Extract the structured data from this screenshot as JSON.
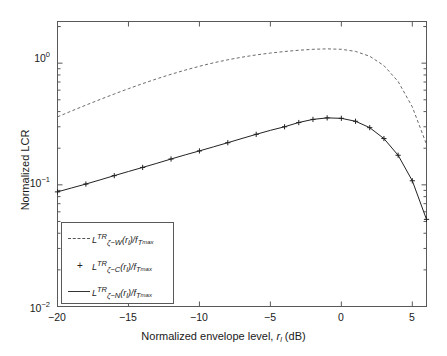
{
  "chart_data": {
    "type": "line",
    "title": "",
    "xlabel": "Normalized envelope level, r_l (dB)",
    "ylabel": "Normalized LCR",
    "xlim": [
      -20,
      6
    ],
    "ylim": [
      0.01,
      2.2
    ],
    "yscale": "log",
    "xticks": [
      -20,
      -15,
      -10,
      -5,
      0,
      5
    ],
    "xticklabels": [
      "−20",
      "−15",
      "−10",
      "−5",
      "0",
      "5"
    ],
    "yticks": [
      0.01,
      0.1,
      1
    ],
    "yticklabels": [
      "10",
      "10",
      "10"
    ],
    "ytick_exponents": [
      "−2",
      "−1",
      "0"
    ],
    "grid": false,
    "legend_position": "lower left",
    "series": [
      {
        "name": "L_zeta-W^TR(r_l)/f_Tmax",
        "style": "dashed",
        "color": "#5a5a5a",
        "marker": "none",
        "x": [
          -20,
          -19,
          -18,
          -17,
          -16,
          -15,
          -14,
          -13,
          -12,
          -11,
          -10,
          -9,
          -8,
          -7,
          -6,
          -5,
          -4,
          -3,
          -2,
          -1,
          0,
          1,
          2,
          3,
          4,
          5,
          6
        ],
        "y": [
          0.362,
          0.405,
          0.452,
          0.503,
          0.558,
          0.617,
          0.679,
          0.744,
          0.81,
          0.877,
          0.943,
          1.007,
          1.066,
          1.12,
          1.169,
          1.211,
          1.247,
          1.277,
          1.3,
          1.311,
          1.3,
          1.249,
          1.14,
          0.955,
          0.707,
          0.437,
          0.215
        ]
      },
      {
        "name": "L_zeta-C^TR(r_l)/f_Tmax",
        "style": "markers",
        "color": "#222222",
        "marker": "+",
        "x": [
          -20,
          -18,
          -16,
          -14,
          -12,
          -10,
          -8,
          -6,
          -4,
          -3,
          -2,
          -1,
          0,
          1,
          2,
          3,
          4,
          5,
          6
        ],
        "y": [
          0.0875,
          0.1015,
          0.119,
          0.139,
          0.163,
          0.19,
          0.222,
          0.26,
          0.3,
          0.325,
          0.345,
          0.355,
          0.352,
          0.333,
          0.295,
          0.24,
          0.175,
          0.108,
          0.052
        ]
      },
      {
        "name": "L_zeta-N^TR(r_l)/f_Tmax",
        "style": "solid",
        "color": "#222222",
        "marker": "none",
        "x": [
          -20,
          -19,
          -18,
          -17,
          -16,
          -15,
          -14,
          -13,
          -12,
          -11,
          -10,
          -9,
          -8,
          -7,
          -6,
          -5,
          -4,
          -3,
          -2,
          -1,
          0,
          1,
          2,
          3,
          4,
          5,
          6
        ],
        "y": [
          0.0875,
          0.0943,
          0.1015,
          0.1098,
          0.119,
          0.1287,
          0.139,
          0.1503,
          0.163,
          0.1763,
          0.19,
          0.2053,
          0.222,
          0.2405,
          0.26,
          0.2805,
          0.3,
          0.3255,
          0.345,
          0.355,
          0.352,
          0.333,
          0.295,
          0.24,
          0.175,
          0.108,
          0.052
        ]
      }
    ]
  },
  "axes": {
    "ylabel": "Normalized LCR",
    "xlabel_prefix": "Normalized envelope level, ",
    "xlabel_var": "r",
    "xlabel_var_sub": "l",
    "xlabel_suffix": " (dB)",
    "xticklabels": [
      "−20",
      "−15",
      "−10",
      "−5",
      "0",
      "5"
    ],
    "ytick_mantissa": "10",
    "ytick_exp_0": "0",
    "ytick_exp_m1": "−1",
    "ytick_exp_m2": "−2"
  },
  "legend": {
    "entries": [
      {
        "sample": "dashed-line-sample",
        "base": "L",
        "sup": "TR",
        "sub": "ζ−W",
        "arg": "(r",
        "arg_sub": "l",
        "arg_close": ")/f",
        "denom_sub": "T",
        "denom_subsub": "max"
      },
      {
        "sample": "plus-marker-sample",
        "base": "L",
        "sup": "TR",
        "sub": "ζ−C",
        "arg": "(r",
        "arg_sub": "l",
        "arg_close": ")/f",
        "denom_sub": "T",
        "denom_subsub": "max"
      },
      {
        "sample": "solid-line-sample",
        "base": "L",
        "sup": "TR",
        "sub": "ζ−N",
        "arg": "(r",
        "arg_sub": "l",
        "arg_close": ")/f",
        "denom_sub": "T",
        "denom_subsub": "max"
      }
    ]
  },
  "colors": {
    "axis": "#595959",
    "dashed_curve": "#5a5a5a",
    "solid_curve": "#222222",
    "background": "#ffffff"
  }
}
